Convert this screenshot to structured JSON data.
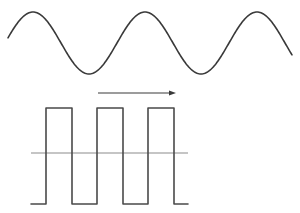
{
  "figure": {
    "title": "Sine wave and square wave signal diagram",
    "width": 300,
    "height": 213,
    "background_color": "#ffffff"
  },
  "colors": {
    "sine_stroke": "#3a3a3a",
    "square_stroke": "#4a4a4a",
    "axis_stroke": "#8c8c8c",
    "arrow_stroke": "#3a3a3a"
  },
  "chart_data": {
    "type": "line",
    "title": "",
    "xlabel": "",
    "ylabel": "",
    "grid": false,
    "legend": null,
    "series": [
      {
        "name": "sine-wave",
        "type": "sine",
        "stroke_width": 1.6,
        "x_start": 8,
        "x_end": 292,
        "baseline_y": 43,
        "amplitude": 31,
        "period": 112,
        "peak_y": 12,
        "trough_y": 74,
        "peaks_x": [
          33,
          145,
          258
        ],
        "troughs_x": [
          91,
          203
        ],
        "start_point": [
          8,
          47
        ],
        "end_point": [
          292,
          47
        ]
      },
      {
        "name": "square-wave",
        "type": "square",
        "stroke_width": 1.6,
        "top_y": 108,
        "bottom_y": 204,
        "baseline_y": 153,
        "edges_x": [
          46,
          72,
          97,
          123,
          148,
          174
        ],
        "high_segments": [
          [
            46,
            72
          ],
          [
            97,
            123
          ],
          [
            148,
            174
          ]
        ],
        "low_segments": [
          [
            72,
            97
          ],
          [
            123,
            148
          ],
          [
            174,
            188
          ]
        ],
        "start_x": 31,
        "end_x": 188
      }
    ],
    "annotations": [
      {
        "name": "direction-arrow",
        "type": "arrow",
        "direction": "right",
        "x_start": 98,
        "x_end": 176,
        "y": 93,
        "head_length": 7,
        "head_width": 5,
        "stroke_width": 1.2,
        "label": ""
      },
      {
        "name": "zero-axis-line",
        "type": "horizontal-line",
        "x_start": 31,
        "x_end": 188,
        "y": 153,
        "stroke_width": 1.1
      }
    ]
  }
}
